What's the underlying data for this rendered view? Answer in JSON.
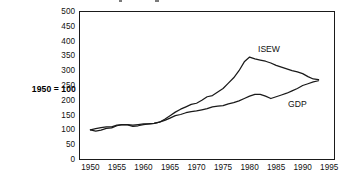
{
  "chart_data": {
    "type": "line",
    "title": "",
    "subtitle": "",
    "xlabel": "",
    "ylabel": "",
    "axis_note": "1950 = 100",
    "grid": false,
    "legend_position": "inline-annotation",
    "xlim": [
      1948,
      1996
    ],
    "ylim": [
      0,
      500
    ],
    "xticks": [
      1950,
      1955,
      1960,
      1965,
      1970,
      1975,
      1980,
      1985,
      1990,
      1995
    ],
    "yticks": [
      0,
      50,
      100,
      150,
      200,
      250,
      300,
      350,
      400,
      450,
      500
    ],
    "xtick_labels": [
      "1950",
      "1955",
      "1960",
      "1965",
      "1970",
      "1975",
      "1980",
      "1985",
      "1990",
      "1995"
    ],
    "ytick_labels": [
      "0",
      "50",
      "100",
      "150",
      "200",
      "250",
      "300",
      "350",
      "400",
      "450",
      "500"
    ],
    "annotations": [
      {
        "text": "ISEW",
        "x": 1987,
        "y": 390
      },
      {
        "text": "GDP",
        "x": 1990,
        "y": 205
      }
    ],
    "series": [
      {
        "name": "ISEW",
        "color": "#1a1a1a",
        "x": [
          1950,
          1951,
          1952,
          1953,
          1954,
          1955,
          1956,
          1957,
          1958,
          1959,
          1960,
          1961,
          1962,
          1963,
          1964,
          1965,
          1966,
          1967,
          1968,
          1969,
          1970,
          1971,
          1972,
          1973,
          1974,
          1975,
          1976,
          1977,
          1978,
          1979,
          1980,
          1981,
          1982,
          1983,
          1984,
          1985,
          1986,
          1987,
          1988,
          1989,
          1990,
          1991,
          1992,
          1993
        ],
        "values": [
          100,
          96,
          99,
          105,
          107,
          114,
          118,
          117,
          112,
          114,
          118,
          120,
          122,
          126,
          136,
          148,
          160,
          170,
          178,
          186,
          190,
          200,
          212,
          216,
          228,
          240,
          258,
          276,
          300,
          330,
          346,
          340,
          336,
          332,
          326,
          318,
          312,
          306,
          300,
          296,
          290,
          280,
          272,
          270
        ]
      },
      {
        "name": "GDP",
        "color": "#1a1a1a",
        "x": [
          1950,
          1951,
          1952,
          1953,
          1954,
          1955,
          1956,
          1957,
          1958,
          1959,
          1960,
          1961,
          1962,
          1963,
          1964,
          1965,
          1966,
          1967,
          1968,
          1969,
          1970,
          1971,
          1972,
          1973,
          1974,
          1975,
          1976,
          1977,
          1978,
          1979,
          1980,
          1981,
          1982,
          1983,
          1984,
          1985,
          1986,
          1987,
          1988,
          1989,
          1990,
          1991,
          1992,
          1993
        ],
        "values": [
          100,
          104,
          108,
          110,
          110,
          116,
          118,
          118,
          116,
          118,
          120,
          120,
          122,
          126,
          132,
          140,
          148,
          152,
          158,
          162,
          164,
          168,
          172,
          178,
          180,
          182,
          188,
          192,
          198,
          206,
          214,
          220,
          220,
          214,
          206,
          212,
          218,
          224,
          232,
          240,
          250,
          256,
          262,
          266
        ]
      }
    ]
  },
  "top_artifacts": [
    {
      "left": 119,
      "width": 3
    },
    {
      "left": 155,
      "width": 4
    }
  ]
}
